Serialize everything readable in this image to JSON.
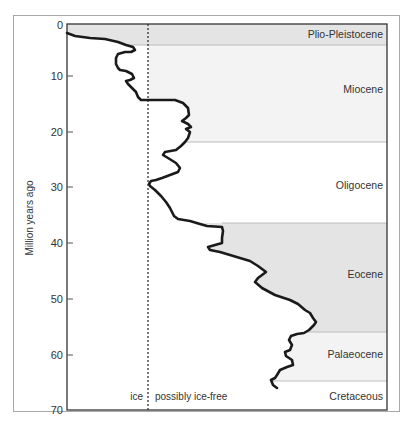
{
  "chart_data": {
    "type": "line",
    "title": "",
    "xlabel": "",
    "ylabel": "Million years ago",
    "ylim": [
      0,
      70
    ],
    "y_inverted": true,
    "yticks": [
      0,
      10,
      20,
      30,
      40,
      50,
      60,
      70
    ],
    "grid": false,
    "legend": null,
    "threshold_line": {
      "style": "dotted",
      "left_label": "ice",
      "right_label": "possibly ice-free"
    },
    "bands": [
      {
        "name": "Plio-Pleistocene",
        "from": 0,
        "to": 3.7,
        "shade": "#e6e6e6"
      },
      {
        "name": "Miocene",
        "from": 3.7,
        "to": 21.5,
        "shade": "#f4f4f4"
      },
      {
        "name": "Oligocene",
        "from": 21.5,
        "to": 36,
        "shade": "#ffffff"
      },
      {
        "name": "Eocene",
        "from": 36,
        "to": 55.5,
        "shade": "#e6e6e6"
      },
      {
        "name": "Palaeocene",
        "from": 55.5,
        "to": 64.5,
        "shade": "#f4f4f4"
      },
      {
        "name": "Cretaceous",
        "from": 64.5,
        "to": 70,
        "shade": "#ffffff"
      }
    ],
    "series": [
      {
        "name": "temperature proxy (relative)",
        "points_px": [
          [
            67,
            33
          ],
          [
            75,
            36
          ],
          [
            90,
            38
          ],
          [
            105,
            39
          ],
          [
            118,
            42
          ],
          [
            126,
            45
          ],
          [
            133,
            47
          ],
          [
            135,
            50
          ],
          [
            131,
            52
          ],
          [
            125,
            52
          ],
          [
            118,
            54
          ],
          [
            116,
            58
          ],
          [
            116,
            64
          ],
          [
            118,
            68
          ],
          [
            120,
            70
          ],
          [
            126,
            71
          ],
          [
            132,
            74
          ],
          [
            134,
            78
          ],
          [
            130,
            80
          ],
          [
            126,
            81
          ],
          [
            128,
            84
          ],
          [
            132,
            88
          ],
          [
            136,
            92
          ],
          [
            138,
            97
          ],
          [
            141,
            100
          ],
          [
            175,
            100
          ],
          [
            183,
            103
          ],
          [
            188,
            108
          ],
          [
            189,
            115
          ],
          [
            186,
            118
          ],
          [
            182,
            121
          ],
          [
            188,
            124
          ],
          [
            191,
            127
          ],
          [
            186,
            129
          ],
          [
            190,
            132
          ],
          [
            188,
            138
          ],
          [
            185,
            142
          ],
          [
            181,
            146
          ],
          [
            176,
            150
          ],
          [
            165,
            152
          ],
          [
            163,
            155
          ],
          [
            168,
            158
          ],
          [
            176,
            163
          ],
          [
            180,
            168
          ],
          [
            178,
            172
          ],
          [
            170,
            175
          ],
          [
            162,
            178
          ],
          [
            156,
            180
          ],
          [
            151,
            181
          ],
          [
            149,
            184
          ],
          [
            150,
            186
          ],
          [
            155,
            190
          ],
          [
            161,
            196
          ],
          [
            166,
            202
          ],
          [
            170,
            208
          ],
          [
            174,
            216
          ],
          [
            178,
            219
          ],
          [
            190,
            221
          ],
          [
            200,
            224
          ],
          [
            207,
            226
          ],
          [
            222,
            227
          ],
          [
            223,
            231
          ],
          [
            222,
            238
          ],
          [
            222,
            243
          ],
          [
            215,
            245
          ],
          [
            208,
            247
          ],
          [
            210,
            250
          ],
          [
            220,
            252
          ],
          [
            230,
            255
          ],
          [
            240,
            258
          ],
          [
            250,
            261
          ],
          [
            258,
            266
          ],
          [
            266,
            272
          ],
          [
            258,
            278
          ],
          [
            255,
            282
          ],
          [
            262,
            288
          ],
          [
            275,
            295
          ],
          [
            290,
            300
          ],
          [
            298,
            304
          ],
          [
            305,
            310
          ],
          [
            310,
            313
          ],
          [
            313,
            318
          ],
          [
            316,
            322
          ],
          [
            314,
            325
          ],
          [
            309,
            330
          ],
          [
            304,
            333
          ],
          [
            297,
            334
          ],
          [
            291,
            336
          ],
          [
            289,
            340
          ],
          [
            292,
            345
          ],
          [
            290,
            350
          ],
          [
            285,
            352
          ],
          [
            286,
            356
          ],
          [
            292,
            360
          ],
          [
            293,
            365
          ],
          [
            287,
            367
          ],
          [
            280,
            370
          ],
          [
            277,
            375
          ],
          [
            275,
            378
          ],
          [
            271,
            380
          ],
          [
            273,
            385
          ],
          [
            277,
            388
          ]
        ]
      }
    ]
  },
  "axis": {
    "ylabel": "Million years ago",
    "ticks": [
      "0",
      "10",
      "20",
      "30",
      "40",
      "50",
      "60",
      "70"
    ]
  },
  "labels": {
    "ice": "ice",
    "ice_free": "possibly ice-free"
  },
  "bands": [
    "Plio-Pleistocene",
    "Miocene",
    "Oligocene",
    "Eocene",
    "Palaeocene",
    "Cretaceous"
  ]
}
